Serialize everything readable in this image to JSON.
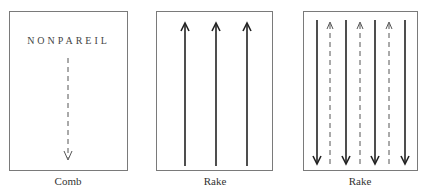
{
  "panels": [
    {
      "title": "NONPAREIL",
      "caption": "Comb",
      "arrows": [
        {
          "style": "dashed",
          "direction": "down"
        }
      ]
    },
    {
      "caption": "Rake",
      "arrows": [
        {
          "style": "solid",
          "direction": "up"
        },
        {
          "style": "solid",
          "direction": "up"
        },
        {
          "style": "solid",
          "direction": "up"
        }
      ]
    },
    {
      "caption": "Rake",
      "arrows": [
        {
          "style": "solid",
          "direction": "down"
        },
        {
          "style": "dashed",
          "direction": "up"
        },
        {
          "style": "solid",
          "direction": "down"
        },
        {
          "style": "dashed",
          "direction": "up"
        },
        {
          "style": "solid",
          "direction": "down"
        },
        {
          "style": "dashed",
          "direction": "up"
        },
        {
          "style": "solid",
          "direction": "down"
        }
      ]
    }
  ],
  "colors": {
    "border": "#7a7a7a",
    "stroke": "#222222",
    "dashed_stroke": "#555555"
  }
}
